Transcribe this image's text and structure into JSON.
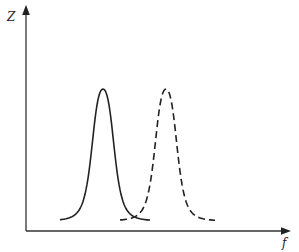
{
  "chart_data": {
    "type": "line",
    "title": "",
    "xlabel": "f",
    "ylabel": "Z",
    "grid": false,
    "legend": null,
    "axis_ranges": {
      "x": [
        0,
        1
      ],
      "y": [
        0,
        1
      ]
    },
    "series": [
      {
        "name": "resonance curve 1",
        "style": "solid",
        "peak_x": 0.29,
        "peak_y": 1.0,
        "x_range": [
          0.13,
          0.47
        ]
      },
      {
        "name": "resonance curve 2",
        "style": "dashed",
        "peak_x": 0.53,
        "peak_y": 1.0,
        "x_range": [
          0.36,
          0.72
        ]
      }
    ]
  },
  "axes": {
    "y_label": "Z",
    "x_label": "f"
  },
  "colors": {
    "stroke": "#222222",
    "background": "#ffffff"
  }
}
